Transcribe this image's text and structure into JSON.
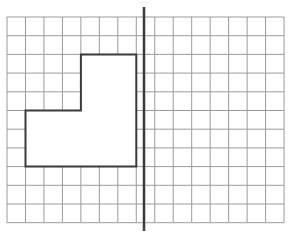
{
  "diagram": {
    "type": "grid-reflection",
    "background": "#ffffff",
    "grid": {
      "columns": 15,
      "rows": 11,
      "origin_x": 7,
      "origin_y": 17,
      "cell_w": 18.47,
      "cell_h": 18.7,
      "line_color": "#9a9a9a"
    },
    "shape": {
      "description": "L-shaped polygon on left of mirror line",
      "vertices_grid": [
        [
          4,
          2
        ],
        [
          7,
          2
        ],
        [
          7,
          8
        ],
        [
          1,
          8
        ],
        [
          1,
          5
        ],
        [
          4,
          5
        ]
      ],
      "stroke": "#3a3a3a",
      "fill": "#ffffff"
    },
    "mirror_line": {
      "x": 144,
      "y1": 7,
      "y2": 231,
      "stroke": "#3a3a3a"
    }
  }
}
